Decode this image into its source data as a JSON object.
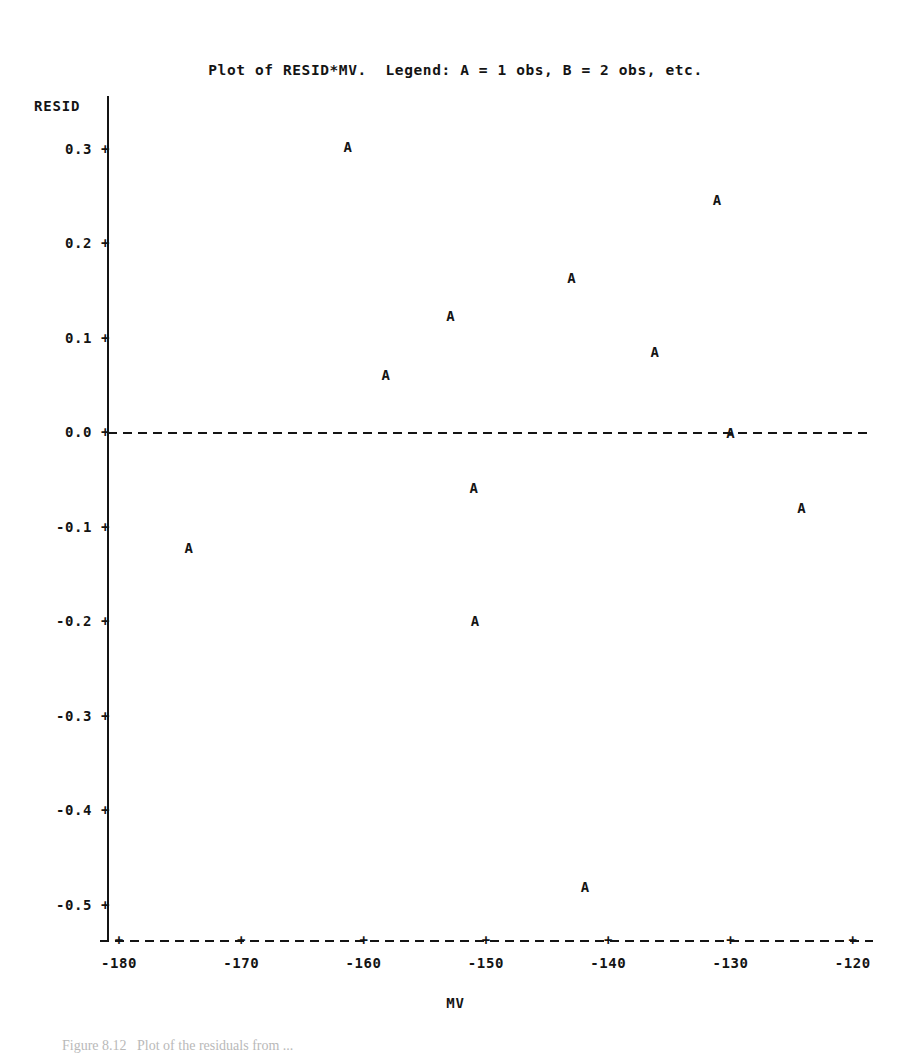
{
  "title": "Plot of RESID*MV.  Legend: A = 1 obs, B = 2 obs, etc.",
  "axes": {
    "y_title": "RESID",
    "x_title": "MV"
  },
  "caption": "Figure 8.12   Plot of the residuals from ...",
  "chart_data": {
    "type": "scatter",
    "title": "Plot of RESID*MV.  Legend: A = 1 obs, B = 2 obs, etc.",
    "xlabel": "MV",
    "ylabel": "RESID",
    "xlim": [
      -181,
      -119
    ],
    "ylim": [
      -0.53,
      0.33
    ],
    "grid": false,
    "legend": "A = 1 obs, B = 2 obs, etc.",
    "marker_symbol": "A",
    "reference_lines": [
      {
        "axis": "y",
        "value": 0.0,
        "style": "dashed"
      }
    ],
    "xticks": [
      -180,
      -170,
      -160,
      -150,
      -140,
      -130,
      -120
    ],
    "xtick_labels": [
      "-180",
      "-170",
      "-160",
      "-150",
      "-140",
      "-130",
      "-120"
    ],
    "yticks": [
      0.3,
      0.2,
      0.1,
      0.0,
      -0.1,
      -0.2,
      -0.3,
      -0.4,
      -0.5
    ],
    "ytick_labels": [
      "0.3",
      "0.2",
      "0.1",
      "0.0",
      "-0.1",
      "-0.2",
      "-0.3",
      "-0.4",
      "-0.5"
    ],
    "x": [
      -161.3,
      -131.1,
      -143.0,
      -152.9,
      -136.2,
      -158.2,
      -130.0,
      -151.0,
      -124.2,
      -174.3,
      -150.9,
      -141.9
    ],
    "y": [
      0.303,
      0.247,
      0.164,
      0.124,
      0.086,
      0.061,
      0.0,
      -0.058,
      -0.079,
      -0.122,
      -0.199,
      -0.48
    ],
    "points": [
      {
        "x": -161.3,
        "y": 0.303,
        "label": "A"
      },
      {
        "x": -131.1,
        "y": 0.247,
        "label": "A"
      },
      {
        "x": -143.0,
        "y": 0.164,
        "label": "A"
      },
      {
        "x": -152.9,
        "y": 0.124,
        "label": "A"
      },
      {
        "x": -136.2,
        "y": 0.086,
        "label": "A"
      },
      {
        "x": -158.2,
        "y": 0.061,
        "label": "A"
      },
      {
        "x": -130.0,
        "y": 0.0,
        "label": "A"
      },
      {
        "x": -151.0,
        "y": -0.058,
        "label": "A"
      },
      {
        "x": -124.2,
        "y": -0.079,
        "label": "A"
      },
      {
        "x": -174.3,
        "y": -0.122,
        "label": "A"
      },
      {
        "x": -150.9,
        "y": -0.199,
        "label": "A"
      },
      {
        "x": -141.9,
        "y": -0.48,
        "label": "A"
      }
    ]
  }
}
